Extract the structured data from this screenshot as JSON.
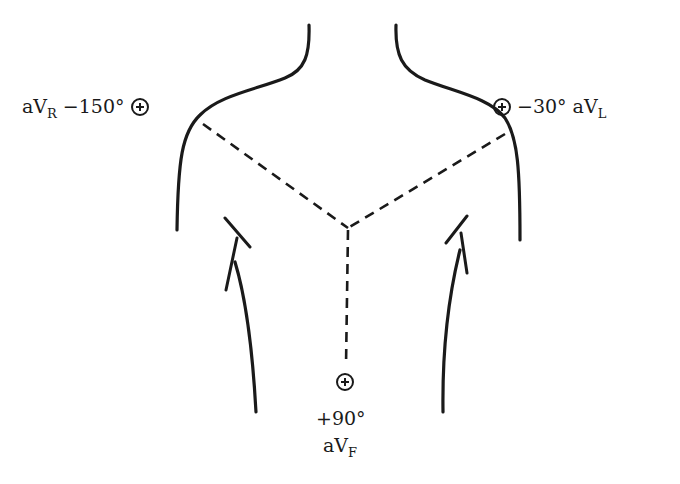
{
  "figure": {
    "type": "hexaxial-lead-diagram",
    "leads": [
      {
        "name": "aV",
        "subscript": "R",
        "angle": "−150°",
        "polarity": "positive"
      },
      {
        "name": "aV",
        "subscript": "L",
        "angle": "−30°",
        "polarity": "positive"
      },
      {
        "name": "aV",
        "subscript": "F",
        "angle": "+90°",
        "polarity": "positive"
      }
    ],
    "stroke_color": "#1a1a1a",
    "background": "#ffffff"
  }
}
